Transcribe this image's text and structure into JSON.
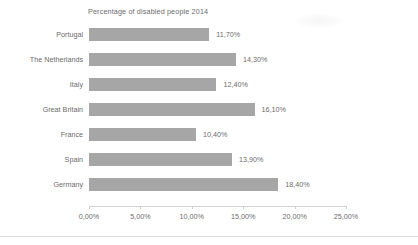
{
  "chart_data": {
    "type": "bar",
    "orientation": "horizontal",
    "title": "Percentage of disabled people 2014",
    "xlabel": "",
    "ylabel": "",
    "categories": [
      "Portugal",
      "The Netherlands",
      "Italy",
      "Great Britain",
      "France",
      "Spain",
      "Germany"
    ],
    "values": [
      11.7,
      14.3,
      12.4,
      16.1,
      10.4,
      13.9,
      18.4
    ],
    "value_labels": [
      "11,70%",
      "14,30%",
      "12,40%",
      "16,10%",
      "10,40%",
      "13,90%",
      "18,40%"
    ],
    "xlim": [
      0,
      25
    ],
    "xticks": [
      0,
      5,
      10,
      15,
      20,
      25
    ],
    "xtick_labels": [
      "0,00%",
      "5,00%",
      "10,00%",
      "15,00%",
      "20,00%",
      "25,00%"
    ],
    "grid": false,
    "legend": null,
    "bar_color": "#a6a6a6",
    "text_color": "#6b6b6b",
    "axis_color": "#d3d3d3",
    "background": "#ffffff"
  },
  "footer": {
    "caption": ""
  }
}
